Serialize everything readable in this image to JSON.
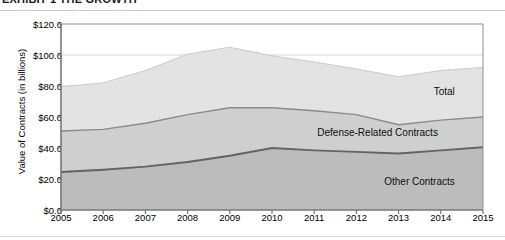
{
  "caption": {
    "text": "EXHIBIT 1 THE GROWTH"
  },
  "chart_data": {
    "type": "area",
    "stacked": true,
    "title": "",
    "subtitle": "",
    "xlabel": "",
    "ylabel": "Value of Contracts (in billions)",
    "categories": [
      "2005",
      "2006",
      "2007",
      "2008",
      "2009",
      "2010",
      "2011",
      "2012",
      "2013",
      "2014",
      "2015"
    ],
    "x": [
      2005,
      2006,
      2007,
      2008,
      2009,
      2010,
      2011,
      2012,
      2013,
      2014,
      2015
    ],
    "ylim": [
      0,
      120
    ],
    "yticks": [
      0,
      20,
      40,
      60,
      80,
      100,
      120
    ],
    "ytick_labels": [
      "$0.0",
      "$20.0",
      "$40.0",
      "$60.0",
      "$80.0",
      "$100.0",
      "$120.0"
    ],
    "grid": true,
    "legend_position": "inline-right",
    "series": [
      {
        "name": "Other Contracts",
        "values": [
          24.5,
          26.0,
          28.0,
          31.0,
          35.0,
          40.0,
          38.5,
          37.5,
          36.5,
          38.5,
          40.5
        ],
        "color": "#bcbcbc",
        "line_color": "#636363"
      },
      {
        "name": "Defense-Related Contracts",
        "values": [
          26.5,
          26.0,
          28.0,
          30.5,
          31.0,
          26.0,
          25.5,
          24.0,
          18.5,
          19.5,
          19.5
        ],
        "color": "#cfcfcf",
        "line_color": "#8a8a8a"
      },
      {
        "name": "Total",
        "values": [
          28.5,
          30.0,
          34.0,
          39.0,
          39.0,
          33.5,
          31.5,
          29.5,
          31.0,
          32.0,
          32.0
        ],
        "color": "#e3e3e3",
        "line_color": "#cacaca"
      }
    ],
    "cumulative": {
      "other_contracts": [
        24.5,
        26.0,
        28.0,
        31.0,
        35.0,
        40.0,
        38.5,
        37.5,
        36.5,
        38.5,
        40.5
      ],
      "defense_related_total": [
        51.0,
        52.0,
        56.0,
        61.5,
        66.0,
        66.0,
        64.0,
        61.5,
        55.0,
        58.0,
        60.0
      ],
      "total": [
        79.5,
        82.0,
        90.0,
        100.5,
        105.0,
        99.5,
        95.5,
        91.0,
        86.0,
        90.0,
        92.0
      ]
    },
    "annotations": [
      {
        "label": "Total",
        "x": 2014.0,
        "y": 76.0
      },
      {
        "label": "Defense-Related Contracts",
        "x": 2013.6,
        "y": 50.0
      },
      {
        "label": "Other Contracts",
        "x": 2014.0,
        "y": 18.0
      }
    ]
  },
  "axis_labels": {
    "y_title": "Value of Contracts (in billions)"
  }
}
